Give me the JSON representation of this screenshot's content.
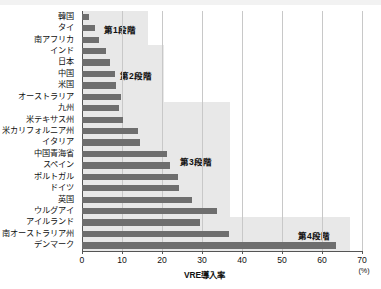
{
  "chart_data": {
    "type": "bar",
    "orientation": "horizontal",
    "title": "",
    "xlabel": "VRE導入率",
    "unit": "(%)",
    "ylabel": "",
    "xlim": [
      0,
      70
    ],
    "xticks": [
      0,
      10,
      20,
      30,
      40,
      50,
      60,
      70
    ],
    "grid": true,
    "legend": "none",
    "categories": [
      "韓国",
      "タイ",
      "南アフリカ",
      "インド",
      "日本",
      "中国",
      "米国",
      "オーストラリア",
      "九州",
      "米テキサス州",
      "米カリフォルニア州",
      "イタリア",
      "中国青海省",
      "スペイン",
      "ポルトガル",
      "ドイツ",
      "英国",
      "ウルグアイ",
      "アイルランド",
      "南オーストラリア州",
      "デンマーク"
    ],
    "values": [
      1.8,
      3.3,
      4.2,
      6.0,
      7.0,
      8.3,
      8.5,
      9.8,
      9.3,
      10.3,
      14.0,
      14.5,
      21.3,
      22.0,
      24.0,
      24.2,
      27.5,
      33.8,
      29.5,
      36.8,
      63.5
    ],
    "bands": [
      {
        "label": "第1段階",
        "x_end": 16.5,
        "row_start": 0,
        "row_end": 2
      },
      {
        "label": "第2段階",
        "x_end": 20.5,
        "row_start": 3,
        "row_end": 7
      },
      {
        "label": "第3段階",
        "x_end": 37.0,
        "row_start": 8,
        "row_end": 17
      },
      {
        "label": "第4段階",
        "x_end": 67.0,
        "row_start": 18,
        "row_end": 20
      }
    ],
    "colors": {
      "bar": "#6e6e6e",
      "band": "#e8e8e8",
      "grid": "#c8c8c8",
      "axis": "#555555",
      "text": "#101010",
      "background": "#ffffff"
    }
  }
}
